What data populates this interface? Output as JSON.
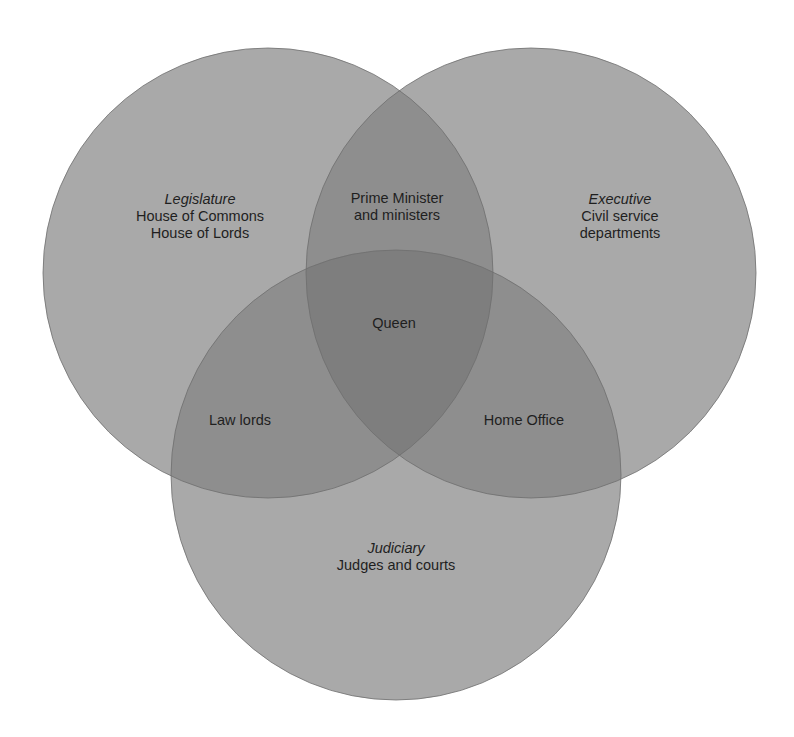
{
  "diagram": {
    "type": "venn",
    "fill_color": "#a9a9a9",
    "overlap2_color": "#8e8e8e",
    "overlap3_color": "#7e7e7e",
    "outline_color": "#6f6f6f",
    "sets": [
      {
        "id": "legislature",
        "title": "Legislature",
        "lines": [
          "House of Commons",
          "House of Lords"
        ],
        "cx": 268,
        "cy": 273,
        "r": 225
      },
      {
        "id": "executive",
        "title": "Executive",
        "lines": [
          "Civil service",
          "departments"
        ],
        "cx": 531,
        "cy": 273,
        "r": 225
      },
      {
        "id": "judiciary",
        "title": "Judiciary",
        "lines": [
          "Judges and courts"
        ],
        "cx": 396,
        "cy": 475,
        "r": 225
      }
    ],
    "intersections": {
      "legislature_executive": {
        "lines": [
          "Prime Minister",
          "and ministers"
        ]
      },
      "legislature_judiciary": {
        "lines": [
          "Law lords"
        ]
      },
      "executive_judiciary": {
        "lines": [
          "Home Office"
        ]
      },
      "all": {
        "lines": [
          "Queen"
        ]
      }
    }
  }
}
